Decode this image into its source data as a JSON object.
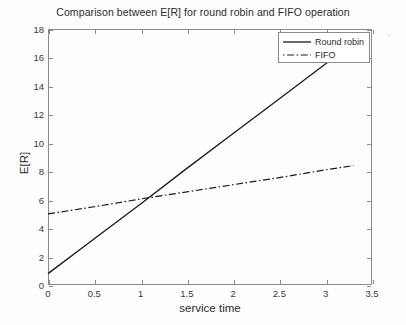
{
  "chart_data": {
    "type": "line",
    "title": "Comparison between E[R] for round robin and FIFO operation",
    "xlabel": "service time",
    "ylabel": "E[R]",
    "xlim": [
      0,
      3.5
    ],
    "ylim": [
      0,
      18
    ],
    "grid": false,
    "legend_position": "top-right",
    "xticks": [
      "0",
      "0.5",
      "1",
      "1.5",
      "2",
      "2.5",
      "3",
      "3.5"
    ],
    "xtick_values": [
      0,
      0.5,
      1,
      1.5,
      2,
      2.5,
      3,
      3.5
    ],
    "yticks": [
      "0",
      "2",
      "4",
      "6",
      "8",
      "10",
      "12",
      "14",
      "16",
      "18"
    ],
    "ytick_values": [
      0,
      2,
      4,
      6,
      8,
      10,
      12,
      14,
      16,
      18
    ],
    "series": [
      {
        "name": "Round robin",
        "style": "solid",
        "color": "#1a1a1a",
        "x": [
          0,
          0.5,
          1,
          1.5,
          2,
          2.5,
          3,
          3.3
        ],
        "values": [
          0.8,
          3.25,
          5.7,
          8.2,
          10.65,
          13.1,
          15.55,
          17.0
        ]
      },
      {
        "name": "FIFO",
        "style": "dash-dot",
        "color": "#1a1a1a",
        "x": [
          0,
          0.5,
          1,
          1.5,
          2,
          2.5,
          3,
          3.3
        ],
        "values": [
          5.0,
          5.5,
          6.05,
          6.55,
          7.05,
          7.55,
          8.1,
          8.4
        ]
      }
    ],
    "annotations": [
      {
        "text": "crossing point near service time = 1.08, E[R] = 6.3"
      }
    ]
  },
  "legend": {
    "entries": [
      {
        "label": "Round robin",
        "swatch": "solid-line-swatch"
      },
      {
        "label": "FIFO",
        "swatch": "dashdot-line-swatch"
      }
    ]
  },
  "artifact": {
    "mark": "'"
  }
}
